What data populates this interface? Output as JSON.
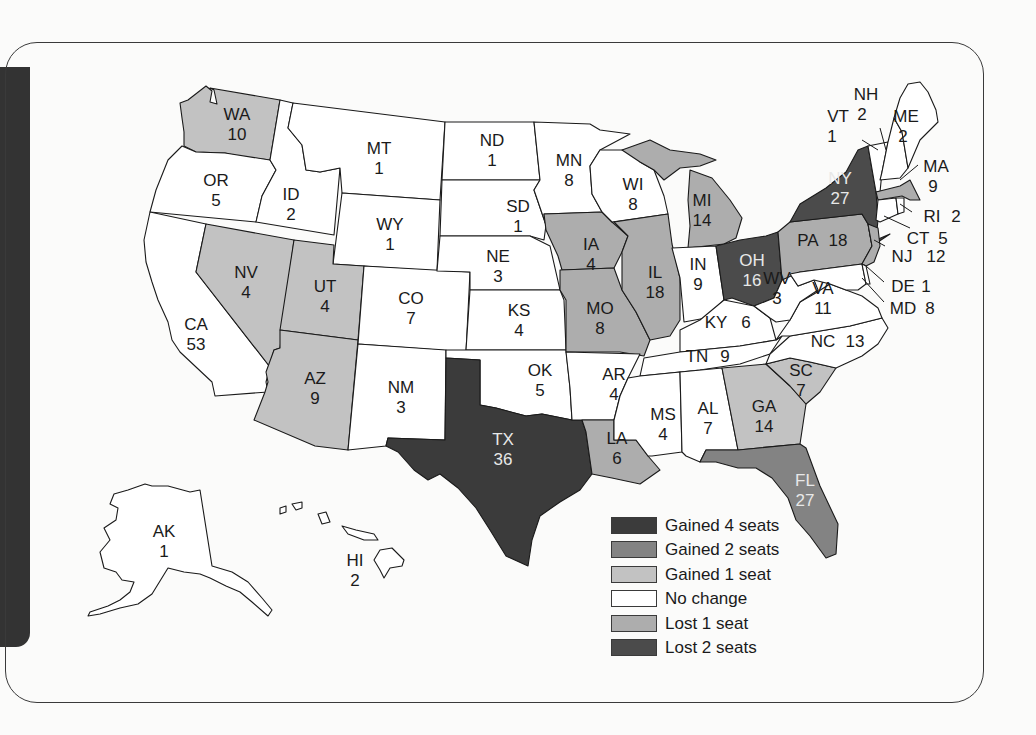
{
  "map": {
    "subject": "U.S. House seats by state after reapportionment",
    "colors": {
      "gained_4": "#3b3b3b",
      "gained_2": "#838383",
      "gained_1": "#c2c2c2",
      "no_change": "#ffffff",
      "lost_1": "#adadad",
      "lost_2": "#4b4b4b"
    },
    "legend": [
      {
        "key": "gained_4",
        "label": "Gained 4 seats"
      },
      {
        "key": "gained_2",
        "label": "Gained 2 seats"
      },
      {
        "key": "gained_1",
        "label": "Gained 1 seat"
      },
      {
        "key": "no_change",
        "label": "No change"
      },
      {
        "key": "lost_1",
        "label": "Lost 1 seat"
      },
      {
        "key": "lost_2",
        "label": "Lost 2 seats"
      }
    ],
    "states": {
      "WA": {
        "abbr": "WA",
        "seats": "10",
        "change": "gained_1"
      },
      "OR": {
        "abbr": "OR",
        "seats": "5",
        "change": "no_change"
      },
      "CA": {
        "abbr": "CA",
        "seats": "53",
        "change": "no_change"
      },
      "ID": {
        "abbr": "ID",
        "seats": "2",
        "change": "no_change"
      },
      "NV": {
        "abbr": "NV",
        "seats": "4",
        "change": "gained_1"
      },
      "MT": {
        "abbr": "MT",
        "seats": "1",
        "change": "no_change"
      },
      "WY": {
        "abbr": "WY",
        "seats": "1",
        "change": "no_change"
      },
      "UT": {
        "abbr": "UT",
        "seats": "4",
        "change": "gained_1"
      },
      "AZ": {
        "abbr": "AZ",
        "seats": "9",
        "change": "gained_1"
      },
      "CO": {
        "abbr": "CO",
        "seats": "7",
        "change": "no_change"
      },
      "NM": {
        "abbr": "NM",
        "seats": "3",
        "change": "no_change"
      },
      "ND": {
        "abbr": "ND",
        "seats": "1",
        "change": "no_change"
      },
      "SD": {
        "abbr": "SD",
        "seats": "1",
        "change": "no_change"
      },
      "NE": {
        "abbr": "NE",
        "seats": "3",
        "change": "no_change"
      },
      "KS": {
        "abbr": "KS",
        "seats": "4",
        "change": "no_change"
      },
      "OK": {
        "abbr": "OK",
        "seats": "5",
        "change": "no_change"
      },
      "TX": {
        "abbr": "TX",
        "seats": "36",
        "change": "gained_4"
      },
      "MN": {
        "abbr": "MN",
        "seats": "8",
        "change": "no_change"
      },
      "IA": {
        "abbr": "IA",
        "seats": "4",
        "change": "lost_1"
      },
      "MO": {
        "abbr": "MO",
        "seats": "8",
        "change": "lost_1"
      },
      "AR": {
        "abbr": "AR",
        "seats": "4",
        "change": "no_change"
      },
      "LA": {
        "abbr": "LA",
        "seats": "6",
        "change": "lost_1"
      },
      "WI": {
        "abbr": "WI",
        "seats": "8",
        "change": "no_change"
      },
      "IL": {
        "abbr": "IL",
        "seats": "18",
        "change": "lost_1"
      },
      "MI": {
        "abbr": "MI",
        "seats": "14",
        "change": "lost_1"
      },
      "IN": {
        "abbr": "IN",
        "seats": "9",
        "change": "no_change"
      },
      "OH": {
        "abbr": "OH",
        "seats": "16",
        "change": "lost_2"
      },
      "KY": {
        "abbr": "KY",
        "seats": "6",
        "change": "no_change"
      },
      "TN": {
        "abbr": "TN",
        "seats": "9",
        "change": "no_change"
      },
      "MS": {
        "abbr": "MS",
        "seats": "4",
        "change": "no_change"
      },
      "AL": {
        "abbr": "AL",
        "seats": "7",
        "change": "no_change"
      },
      "GA": {
        "abbr": "GA",
        "seats": "14",
        "change": "gained_1"
      },
      "FL": {
        "abbr": "FL",
        "seats": "27",
        "change": "gained_2"
      },
      "SC": {
        "abbr": "SC",
        "seats": "7",
        "change": "gained_1"
      },
      "NC": {
        "abbr": "NC",
        "seats": "13",
        "change": "no_change"
      },
      "VA": {
        "abbr": "VA",
        "seats": "11",
        "change": "no_change"
      },
      "WV": {
        "abbr": "WV",
        "seats": "3",
        "change": "no_change"
      },
      "PA": {
        "abbr": "PA",
        "seats": "18",
        "change": "lost_1"
      },
      "NY": {
        "abbr": "NY",
        "seats": "27",
        "change": "lost_2"
      },
      "VT": {
        "abbr": "VT",
        "seats": "1",
        "change": "no_change"
      },
      "NH": {
        "abbr": "NH",
        "seats": "2",
        "change": "no_change"
      },
      "ME": {
        "abbr": "ME",
        "seats": "2",
        "change": "no_change"
      },
      "MA": {
        "abbr": "MA",
        "seats": "9",
        "change": "lost_1"
      },
      "RI": {
        "abbr": "RI",
        "seats": "2",
        "change": "no_change"
      },
      "CT": {
        "abbr": "CT",
        "seats": "5",
        "change": "no_change"
      },
      "NJ": {
        "abbr": "NJ",
        "seats": "12",
        "change": "lost_1"
      },
      "DE": {
        "abbr": "DE",
        "seats": "1",
        "change": "no_change"
      },
      "MD": {
        "abbr": "MD",
        "seats": "8",
        "change": "no_change"
      },
      "AK": {
        "abbr": "AK",
        "seats": "1",
        "change": "no_change"
      },
      "HI": {
        "abbr": "HI",
        "seats": "2",
        "change": "no_change"
      }
    }
  }
}
